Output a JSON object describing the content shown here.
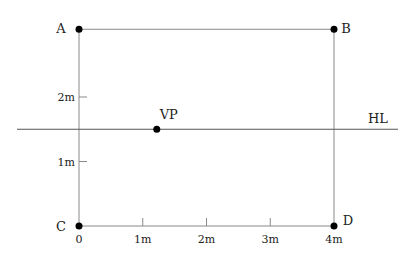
{
  "diagram": {
    "title": "",
    "units": "m",
    "colors": {
      "frame": "#8a8a8a",
      "horizon": "#555555",
      "point": "#000000",
      "text": "#222222"
    },
    "points": [
      {
        "id": "A",
        "label": "A",
        "x": 0,
        "y": 3.05
      },
      {
        "id": "B",
        "label": "B",
        "x": 4,
        "y": 3.05
      },
      {
        "id": "C",
        "label": "C",
        "x": 0,
        "y": 0
      },
      {
        "id": "D",
        "label": "D",
        "x": 4,
        "y": 0
      },
      {
        "id": "VP",
        "label": "VP",
        "x": 1.22,
        "y": 1.5
      }
    ],
    "horizon_line": {
      "label": "HL",
      "y": 1.5
    },
    "x_axis": {
      "ticks": [
        {
          "value": 0,
          "label": "0"
        },
        {
          "value": 1,
          "label": "1m"
        },
        {
          "value": 2,
          "label": "2m"
        },
        {
          "value": 3,
          "label": "3m"
        },
        {
          "value": 4,
          "label": "4m"
        }
      ]
    },
    "y_axis": {
      "ticks": [
        {
          "value": 1,
          "label": "1m"
        },
        {
          "value": 2,
          "label": "2m"
        }
      ]
    }
  }
}
